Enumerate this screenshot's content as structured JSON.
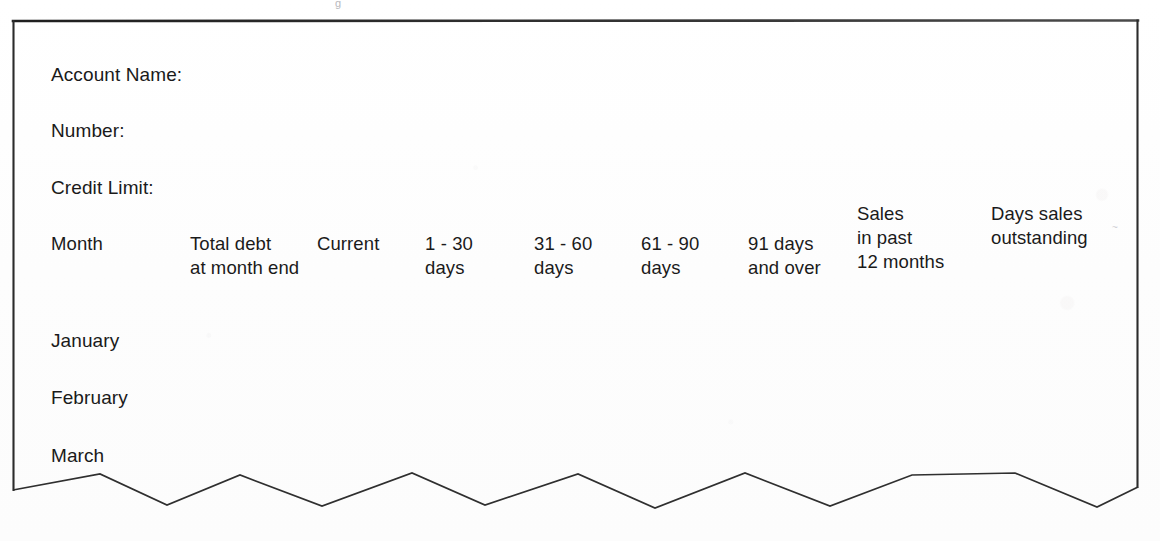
{
  "document": {
    "type": "aged-debtors-analysis-form",
    "background_color": "#fefefe",
    "ink_color": "#1a1a1a",
    "border_color": "#2b2b2b"
  },
  "fields": [
    {
      "label": "Account Name:",
      "x": 51,
      "y": 62
    },
    {
      "label": "Number:",
      "x": 51,
      "y": 118
    },
    {
      "label": "Credit Limit:",
      "x": 51,
      "y": 175
    }
  ],
  "table": {
    "columns": [
      {
        "id": "month",
        "lines": [
          "Month"
        ],
        "x": 51,
        "y": 232
      },
      {
        "id": "total-debt",
        "lines": [
          "Total debt",
          "at month end"
        ],
        "x": 190,
        "y": 232
      },
      {
        "id": "current",
        "lines": [
          "Current"
        ],
        "x": 317,
        "y": 232
      },
      {
        "id": "days-1-30",
        "lines": [
          "1 - 30",
          "days"
        ],
        "x": 425,
        "y": 232
      },
      {
        "id": "days-31-60",
        "lines": [
          "31 - 60",
          "days"
        ],
        "x": 534,
        "y": 232
      },
      {
        "id": "days-61-90",
        "lines": [
          "61 - 90",
          "days"
        ],
        "x": 641,
        "y": 232
      },
      {
        "id": "days-91-and-over",
        "lines": [
          "91 days",
          "and over"
        ],
        "x": 748,
        "y": 232
      },
      {
        "id": "sales-past-12-months",
        "lines": [
          "Sales",
          "in past",
          "12 months"
        ],
        "x": 857,
        "y": 202
      },
      {
        "id": "days-sales-outstanding",
        "lines": [
          "Days sales",
          "outstanding"
        ],
        "x": 991,
        "y": 202
      }
    ],
    "rows": [
      {
        "label": "January",
        "x": 51,
        "y": 328
      },
      {
        "label": "February",
        "x": 51,
        "y": 385
      },
      {
        "label": "March",
        "x": 51,
        "y": 443
      }
    ]
  },
  "frame": {
    "left": 13,
    "right": 1138,
    "top": 21,
    "left_bottom": 490,
    "right_bottom": 487,
    "stroke_width": 2.2,
    "torn_edge": {
      "description": "hand-drawn zigzag line forming the torn bottom edge of the form",
      "peak_y": 474,
      "trough_y": 506,
      "stroke_width": 1.7,
      "points": "13,490 100,474 167,505 240,475 322,506 412,473 485,505 578,474 655,508 745,473 830,506 912,475 1015,473 1097,507 1138,487"
    }
  },
  "artifacts": {
    "top_mark": "g",
    "right_mark": "~"
  }
}
